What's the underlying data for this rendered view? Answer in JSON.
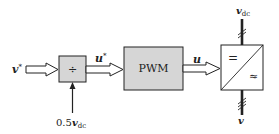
{
  "diagram": {
    "type": "block-diagram",
    "inputs": {
      "v_star": {
        "symbol": "v",
        "superscript": "*"
      },
      "half_vdc": {
        "prefix": "0.5",
        "symbol": "v",
        "subscript": "dc"
      }
    },
    "blocks": {
      "divider": {
        "label": "÷"
      },
      "pwm": {
        "label": "PWM"
      },
      "converter": {
        "dc_symbol": "=",
        "ac_symbol": "≈"
      }
    },
    "signals": {
      "u_star": {
        "symbol": "u",
        "superscript": "*"
      },
      "u": {
        "symbol": "u"
      },
      "v_dc": {
        "symbol": "v",
        "subscript": "dc"
      },
      "v": {
        "symbol": "v"
      }
    },
    "colors": {
      "block_fill": "#d6d6d6",
      "converter_fill": "#ffffff",
      "stroke": "#222222"
    }
  }
}
